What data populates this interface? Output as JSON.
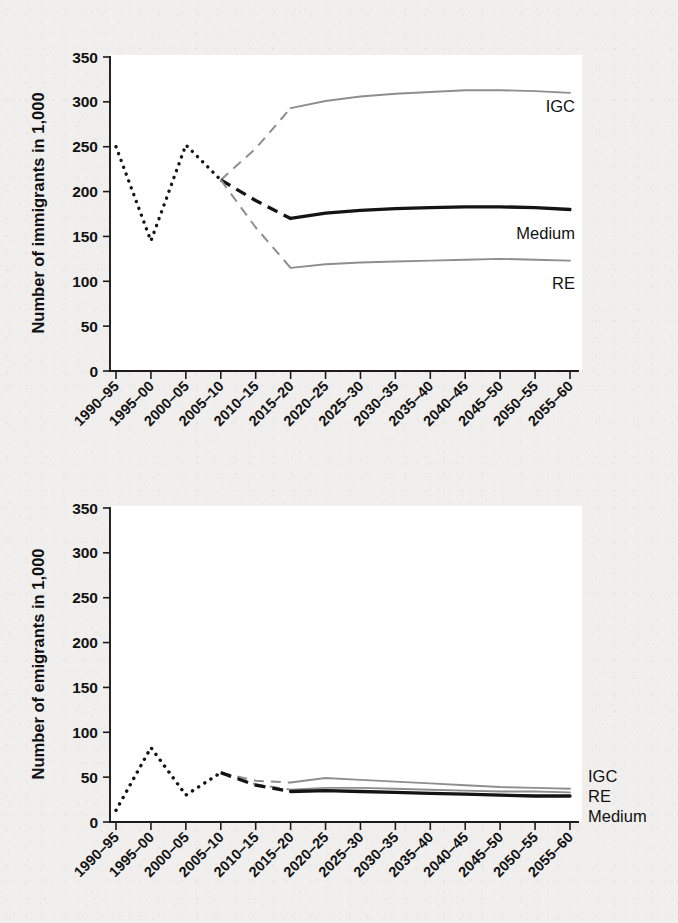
{
  "figure": {
    "background_color": "#f0efed",
    "plot_background_color": "#ffffff",
    "axis_color": "#1b1b1b",
    "historical_color": "#141414",
    "medium_color": "#141414",
    "variant_color": "#8e8e8e"
  },
  "charts": [
    {
      "id": "immigrants",
      "ylabel": "Number of immigrants in 1,000",
      "series_labels": {
        "igc": "IGC",
        "medium": "Medium",
        "re": "RE"
      }
    },
    {
      "id": "emigrants",
      "ylabel": "Number of emigrants in 1,000",
      "series_labels": {
        "igc": "IGC",
        "re": "RE",
        "medium": "Medium"
      }
    }
  ],
  "chart_data": [
    {
      "type": "line",
      "title": "",
      "xlabel": "",
      "ylabel": "Number of immigrants in 1,000",
      "ylim": [
        0,
        350
      ],
      "yticks": [
        0,
        50,
        100,
        150,
        200,
        250,
        300,
        350
      ],
      "ytick_labels": [
        "0",
        "50",
        "100",
        "150",
        "200",
        "250",
        "300",
        "350"
      ],
      "grid": false,
      "legend": "inline-right-of-line",
      "categories": [
        "1990–95",
        "1995–00",
        "2000–05",
        "2005–10",
        "2010–15",
        "2015–20",
        "2020–25",
        "2025–30",
        "2030–35",
        "2035–40",
        "2040–45",
        "2045–50",
        "2050–55",
        "2055–60"
      ],
      "series": [
        {
          "name": "Historical (observed)",
          "style": "dotted",
          "color": "#141414",
          "x": [
            "1990–95",
            "1995–00",
            "2000–05",
            "2005–10"
          ],
          "values": [
            250,
            145,
            252,
            213
          ]
        },
        {
          "name": "IGC",
          "style": "dashed-then-solid",
          "color": "#8e8e8e",
          "x": [
            "2005–10",
            "2010–15",
            "2015–20",
            "2020–25",
            "2025–30",
            "2030–35",
            "2035–40",
            "2040–45",
            "2045–50",
            "2050–55",
            "2055–60"
          ],
          "values": [
            213,
            248,
            293,
            301,
            306,
            309,
            311,
            313,
            313,
            312,
            310
          ],
          "dashed_until": "2015–20"
        },
        {
          "name": "Medium",
          "style": "dashed-then-solid",
          "color": "#141414",
          "x": [
            "2005–10",
            "2010–15",
            "2015–20",
            "2020–25",
            "2025–30",
            "2030–35",
            "2035–40",
            "2040–45",
            "2045–50",
            "2050–55",
            "2055–60"
          ],
          "values": [
            213,
            190,
            170,
            176,
            179,
            181,
            182,
            183,
            183,
            182,
            180
          ],
          "dashed_until": "2015–20"
        },
        {
          "name": "RE",
          "style": "dashed-then-solid",
          "color": "#8e8e8e",
          "x": [
            "2005–10",
            "2010–15",
            "2015–20",
            "2020–25",
            "2025–30",
            "2030–35",
            "2035–40",
            "2040–45",
            "2045–50",
            "2050–55",
            "2055–60"
          ],
          "values": [
            213,
            160,
            115,
            119,
            121,
            122,
            123,
            124,
            125,
            124,
            123
          ],
          "dashed_until": "2015–20"
        }
      ]
    },
    {
      "type": "line",
      "title": "",
      "xlabel": "",
      "ylabel": "Number of emigrants in 1,000",
      "ylim": [
        0,
        350
      ],
      "yticks": [
        0,
        50,
        100,
        150,
        200,
        250,
        300,
        350
      ],
      "ytick_labels": [
        "0",
        "50",
        "100",
        "150",
        "200",
        "250",
        "300",
        "350"
      ],
      "grid": false,
      "legend": "right-outside",
      "categories": [
        "1990–95",
        "1995–00",
        "2000–05",
        "2005–10",
        "2010–15",
        "2015–20",
        "2020–25",
        "2025–30",
        "2030–35",
        "2035–40",
        "2040–45",
        "2045–50",
        "2050–55",
        "2055–60"
      ],
      "series": [
        {
          "name": "Historical (observed)",
          "style": "dotted",
          "color": "#141414",
          "x": [
            "1990–95",
            "1995–00",
            "2000–05",
            "2005–10"
          ],
          "values": [
            13,
            83,
            30,
            55
          ]
        },
        {
          "name": "IGC",
          "style": "dashed-then-solid",
          "color": "#8e8e8e",
          "x": [
            "2005–10",
            "2010–15",
            "2015–20",
            "2020–25",
            "2025–30",
            "2030–35",
            "2035–40",
            "2040–45",
            "2045–50",
            "2050–55",
            "2055–60"
          ],
          "values": [
            55,
            46,
            44,
            49,
            47,
            45,
            43,
            41,
            39,
            38,
            37
          ],
          "dashed_until": "2015–20"
        },
        {
          "name": "RE",
          "style": "dashed-then-solid",
          "color": "#8e8e8e",
          "x": [
            "2005–10",
            "2010–15",
            "2015–20",
            "2020–25",
            "2025–30",
            "2030–35",
            "2035–40",
            "2040–45",
            "2045–50",
            "2050–55",
            "2055–60"
          ],
          "values": [
            55,
            42,
            36,
            38,
            38,
            37,
            36,
            35,
            34,
            34,
            33
          ],
          "dashed_until": "2015–20"
        },
        {
          "name": "Medium",
          "style": "dashed-then-solid",
          "color": "#141414",
          "x": [
            "2005–10",
            "2010–15",
            "2015–20",
            "2020–25",
            "2025–30",
            "2030–35",
            "2035–40",
            "2040–45",
            "2045–50",
            "2050–55",
            "2055–60"
          ],
          "values": [
            55,
            41,
            34,
            35,
            34,
            33,
            32,
            31,
            30,
            29,
            29
          ],
          "dashed_until": "2015–20"
        }
      ]
    }
  ]
}
